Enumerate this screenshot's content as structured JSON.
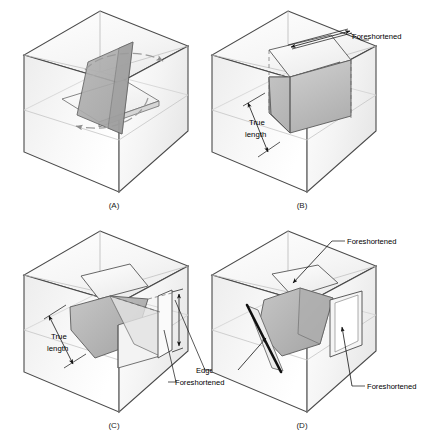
{
  "figure": {
    "background_color": "#ffffff",
    "line_color": "#3a3a3a",
    "dark_line_color": "#1a1a1a",
    "glass_box_face_light": "#fbfbfb",
    "glass_box_face_mid": "#f2f2f2",
    "glass_box_face_shade": "#e9e9e9",
    "plane_fill_dark": "#a8a8a8",
    "plane_fill_mid": "#bcbcbc",
    "plane_fill_light": "#d8d8d8",
    "plane_fill_white": "#f7f7f7"
  },
  "panels": [
    {
      "id": "A",
      "caption": "(A)",
      "annotations": []
    },
    {
      "id": "B",
      "caption": "(B)",
      "annotations": [
        {
          "name": "foreshortened-top",
          "text": "Foreshortened"
        },
        {
          "name": "true-length",
          "text_line1": "True",
          "text_line2": "length"
        }
      ]
    },
    {
      "id": "C",
      "caption": "(C)",
      "annotations": [
        {
          "name": "true-length",
          "text_line1": "True",
          "text_line2": "length"
        },
        {
          "name": "edge-view",
          "text": "Edge view"
        },
        {
          "name": "foreshortened-right",
          "text": "Foreshortened"
        }
      ]
    },
    {
      "id": "D",
      "caption": "(D)",
      "annotations": [
        {
          "name": "foreshortened-top",
          "text": "Foreshortened"
        },
        {
          "name": "foreshortened-front",
          "text": "Foreshortened"
        }
      ]
    }
  ],
  "labels": {
    "caption_a": "(A)",
    "caption_b": "(B)",
    "caption_c": "(C)",
    "caption_d": "(D)",
    "foreshortened": "Foreshortened",
    "true_word": "True",
    "length_word": "length",
    "edge_view": "Edge view"
  }
}
